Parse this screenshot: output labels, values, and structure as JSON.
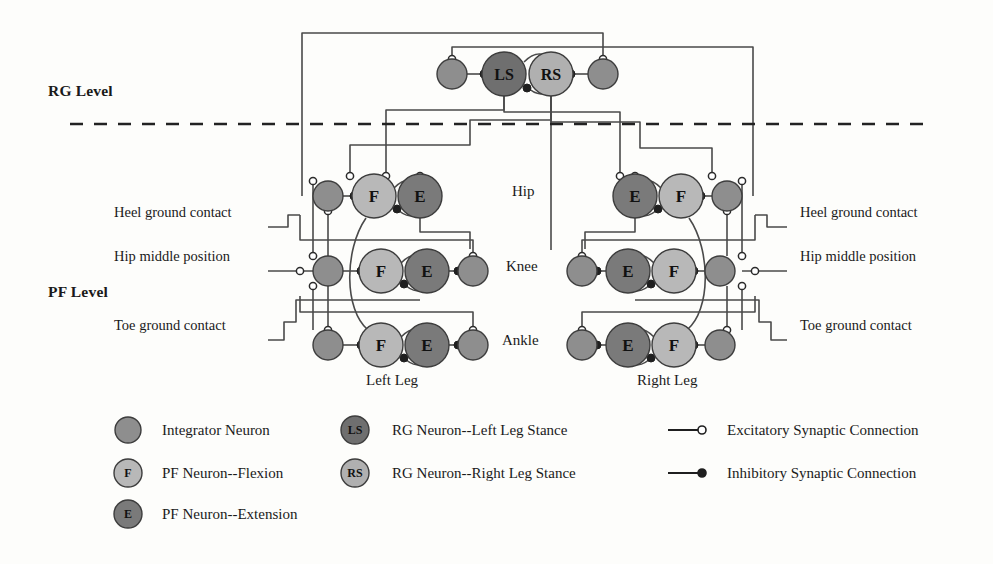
{
  "levels": {
    "rg": "RG Level",
    "pf": "PF Level"
  },
  "rg_neurons": [
    {
      "id": "LS",
      "label": "LS",
      "kind": "rg-left-stance",
      "cx": 504,
      "cy": 74,
      "r": 22,
      "fill": "#6f6f6f"
    },
    {
      "id": "RS",
      "label": "RS",
      "kind": "rg-right-stance",
      "cx": 551,
      "cy": 74,
      "r": 22,
      "fill": "#b0b0b0"
    }
  ],
  "rg_integrators": [
    {
      "id": "rg-int-left",
      "cx": 452,
      "cy": 74,
      "r": 15
    },
    {
      "id": "rg-int-right",
      "cx": 603,
      "cy": 74,
      "r": 15
    }
  ],
  "joints": [
    {
      "name": "Hip",
      "y": 196,
      "label": "Hip",
      "lx": 512,
      "ly": 188
    },
    {
      "name": "Knee",
      "y": 271,
      "label": "Knee",
      "lx": 506,
      "ly": 263
    },
    {
      "name": "Ankle",
      "y": 345,
      "label": "Ankle",
      "lx": 502,
      "ly": 337
    }
  ],
  "legs": [
    {
      "side": "left",
      "label": "Left Leg",
      "label_x": 366,
      "label_y": 385,
      "rows": [
        {
          "joint": "Hip",
          "integrator_in": {
            "cx": 328,
            "cy": 196,
            "r": 15
          },
          "flexion": {
            "cx": 374,
            "cy": 196,
            "r": 22,
            "label": "F"
          },
          "extension": {
            "cx": 420,
            "cy": 196,
            "r": 22,
            "label": "E"
          },
          "integrator_out": null
        },
        {
          "joint": "Knee",
          "integrator_in": {
            "cx": 328,
            "cy": 271,
            "r": 15
          },
          "flexion": {
            "cx": 381,
            "cy": 271,
            "r": 22,
            "label": "F"
          },
          "extension": {
            "cx": 427,
            "cy": 271,
            "r": 22,
            "label": "E"
          },
          "integrator_out": {
            "cx": 473,
            "cy": 271,
            "r": 15
          }
        },
        {
          "joint": "Ankle",
          "integrator_in": {
            "cx": 328,
            "cy": 345,
            "r": 15
          },
          "flexion": {
            "cx": 381,
            "cy": 345,
            "r": 22,
            "label": "F"
          },
          "extension": {
            "cx": 427,
            "cy": 345,
            "r": 22,
            "label": "E"
          },
          "integrator_out": {
            "cx": 473,
            "cy": 345,
            "r": 15
          }
        }
      ]
    },
    {
      "side": "right",
      "label": "Right Leg",
      "label_x": 637,
      "label_y": 385,
      "rows": [
        {
          "joint": "Hip",
          "integrator_in": {
            "cx": 727,
            "cy": 196,
            "r": 15
          },
          "flexion": {
            "cx": 681,
            "cy": 196,
            "r": 22,
            "label": "F"
          },
          "extension": {
            "cx": 635,
            "cy": 196,
            "r": 22,
            "label": "E"
          },
          "integrator_out": null
        },
        {
          "joint": "Knee",
          "integrator_in": {
            "cx": 720,
            "cy": 271,
            "r": 15
          },
          "flexion": {
            "cx": 674,
            "cy": 271,
            "r": 22,
            "label": "F"
          },
          "extension": {
            "cx": 628,
            "cy": 271,
            "r": 22,
            "label": "E"
          },
          "integrator_out": {
            "cx": 582,
            "cy": 271,
            "r": 15
          }
        },
        {
          "joint": "Ankle",
          "integrator_in": {
            "cx": 720,
            "cy": 345,
            "r": 15
          },
          "flexion": {
            "cx": 674,
            "cy": 345,
            "r": 22,
            "label": "F"
          },
          "extension": {
            "cx": 628,
            "cy": 345,
            "r": 22,
            "label": "E"
          },
          "integrator_out": {
            "cx": 582,
            "cy": 345,
            "r": 15
          }
        }
      ]
    }
  ],
  "sensory_inputs": {
    "left": [
      {
        "name": "heel",
        "label": "Heel ground contact",
        "x": 114,
        "y": 212
      },
      {
        "name": "hip-mid",
        "label": "Hip middle position",
        "x": 114,
        "y": 256
      },
      {
        "name": "toe",
        "label": "Toe ground contact",
        "x": 114,
        "y": 325
      }
    ],
    "right": [
      {
        "name": "heel",
        "label": "Heel ground contact",
        "x": 800,
        "y": 212
      },
      {
        "name": "hip-mid",
        "label": "Hip middle position",
        "x": 800,
        "y": 256
      },
      {
        "name": "toe",
        "label": "Toe ground contact",
        "x": 800,
        "y": 325
      }
    ]
  },
  "legend": {
    "items": [
      {
        "key": "integrator",
        "symbol": "circle",
        "fill": "#8e8e8e",
        "glyph": "",
        "label": "Integrator Neuron",
        "col": 1,
        "row": 1
      },
      {
        "key": "pf-flexion",
        "symbol": "circle",
        "fill": "#b8b8b8",
        "glyph": "F",
        "label": "PF Neuron--Flexion",
        "col": 1,
        "row": 2
      },
      {
        "key": "pf-extension",
        "symbol": "circle",
        "fill": "#7a7a7a",
        "glyph": "E",
        "label": "PF Neuron--Extension",
        "col": 1,
        "row": 3
      },
      {
        "key": "rg-left",
        "symbol": "circle",
        "fill": "#6f6f6f",
        "glyph": "LS",
        "label": "RG Neuron--Left Leg Stance",
        "col": 2,
        "row": 1
      },
      {
        "key": "rg-right",
        "symbol": "circle",
        "fill": "#b0b0b0",
        "glyph": "RS",
        "label": "RG Neuron--Right Leg Stance",
        "col": 2,
        "row": 2
      },
      {
        "key": "excitatory",
        "symbol": "line-open",
        "fill": "none",
        "glyph": "",
        "label": "Excitatory Synaptic Connection",
        "col": 3,
        "row": 1
      },
      {
        "key": "inhibitory",
        "symbol": "line-filled",
        "fill": "#1a1a1a",
        "glyph": "",
        "label": "Inhibitory Synaptic Connection",
        "col": 3,
        "row": 2
      }
    ]
  },
  "colors": {
    "integrator": "#8e8e8e",
    "flexion": "#b8b8b8",
    "extension": "#7a7a7a",
    "rg_left": "#6f6f6f",
    "rg_right": "#b0b0b0",
    "wire": "#4a4a4a",
    "text": "#1a1a1a",
    "divider": "#222222"
  },
  "divider": {
    "name": "rg-pf-divider",
    "y": 124,
    "x1": 70,
    "x2": 930,
    "style": "dashed"
  }
}
